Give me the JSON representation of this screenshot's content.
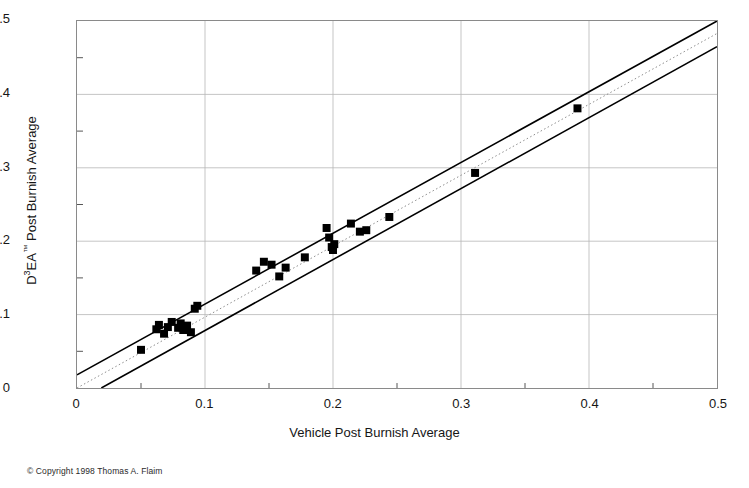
{
  "chart_data": {
    "type": "scatter",
    "title": "Regressed Specific Torque",
    "xlabel": "Vehicle Post Burnish Average",
    "ylabel": "D³EA™ Post Burnish Average",
    "ylabel_parts": {
      "lead": "D",
      "sup": "3",
      "mid": "EA",
      "tm": "™",
      "tail": " Post Burnish Average"
    },
    "xlim": [
      0,
      0.5
    ],
    "ylim": [
      0,
      0.5
    ],
    "xticks": [
      "0",
      "0.1",
      "0.2",
      "0.3",
      "0.4",
      "0.5"
    ],
    "xtick_values": [
      0,
      0.1,
      0.2,
      0.3,
      0.4,
      0.5
    ],
    "yticks": [
      "0",
      "0.1",
      "0.2",
      "0.3",
      "0.4",
      "0.5"
    ],
    "ytick_values": [
      0,
      0.1,
      0.2,
      0.3,
      0.4,
      0.5
    ],
    "minor_tick_step": 0.05,
    "grid": true,
    "grid_color": "#b6b6b6",
    "legend": "none",
    "marker": {
      "shape": "square",
      "color": "#000000",
      "size_px": 8
    },
    "points": [
      {
        "x": 0.05,
        "y": 0.052
      },
      {
        "x": 0.062,
        "y": 0.08
      },
      {
        "x": 0.064,
        "y": 0.086
      },
      {
        "x": 0.068,
        "y": 0.074
      },
      {
        "x": 0.071,
        "y": 0.083
      },
      {
        "x": 0.074,
        "y": 0.09
      },
      {
        "x": 0.079,
        "y": 0.082
      },
      {
        "x": 0.081,
        "y": 0.088
      },
      {
        "x": 0.083,
        "y": 0.079
      },
      {
        "x": 0.086,
        "y": 0.085
      },
      {
        "x": 0.089,
        "y": 0.076
      },
      {
        "x": 0.092,
        "y": 0.108
      },
      {
        "x": 0.094,
        "y": 0.112
      },
      {
        "x": 0.14,
        "y": 0.16
      },
      {
        "x": 0.146,
        "y": 0.172
      },
      {
        "x": 0.152,
        "y": 0.168
      },
      {
        "x": 0.158,
        "y": 0.152
      },
      {
        "x": 0.163,
        "y": 0.164
      },
      {
        "x": 0.178,
        "y": 0.178
      },
      {
        "x": 0.195,
        "y": 0.218
      },
      {
        "x": 0.197,
        "y": 0.205
      },
      {
        "x": 0.199,
        "y": 0.192
      },
      {
        "x": 0.2,
        "y": 0.188
      },
      {
        "x": 0.201,
        "y": 0.196
      },
      {
        "x": 0.214,
        "y": 0.224
      },
      {
        "x": 0.221,
        "y": 0.213
      },
      {
        "x": 0.226,
        "y": 0.215
      },
      {
        "x": 0.244,
        "y": 0.233
      },
      {
        "x": 0.311,
        "y": 0.293
      },
      {
        "x": 0.391,
        "y": 0.381
      }
    ],
    "lines": [
      {
        "name": "regression-fit",
        "style": "dotted",
        "color": "#8c8c8c",
        "x0": 0.0,
        "y0": 0.0,
        "x1": 0.5,
        "y1": 0.483
      },
      {
        "name": "upper-confidence-band",
        "style": "solid",
        "color": "#000000",
        "x0": 0.0,
        "y0": 0.018,
        "x1": 0.5,
        "y1": 0.5
      },
      {
        "name": "lower-confidence-band",
        "style": "solid",
        "color": "#000000",
        "x0": 0.019,
        "y0": 0.0,
        "x1": 0.5,
        "y1": 0.465
      }
    ]
  },
  "footer": {
    "copyright": "© Copyright 1998 Thomas A. Flaim"
  }
}
